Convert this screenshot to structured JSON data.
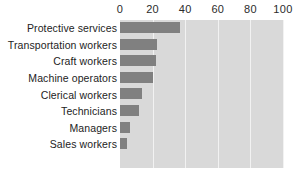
{
  "chart_data": {
    "type": "bar",
    "orientation": "horizontal",
    "title": "",
    "subtitle": "",
    "xlabel": "",
    "ylabel": "",
    "categories": [
      "Protective services",
      "Transportation workers",
      "Craft workers",
      "Machine operators",
      "Clerical workers",
      "Technicians",
      "Managers",
      "Sales workers"
    ],
    "values": [
      37,
      23,
      22,
      20,
      13.5,
      11.5,
      6,
      4
    ],
    "xlim": [
      0,
      100
    ],
    "xticks": [
      0,
      20,
      40,
      60,
      80,
      100
    ],
    "xtick_labels": [
      "0",
      "20",
      "40",
      "60",
      "80",
      "100"
    ],
    "grid": true,
    "grid_axis": "x",
    "legend": false,
    "legend_position": "none",
    "axis_position": "top",
    "colors": {
      "bar": "#808080",
      "plot_background": "#d9d9d9",
      "gridline": "#f2f2f2",
      "page_background": "#ffffff",
      "text": "#232323"
    }
  }
}
